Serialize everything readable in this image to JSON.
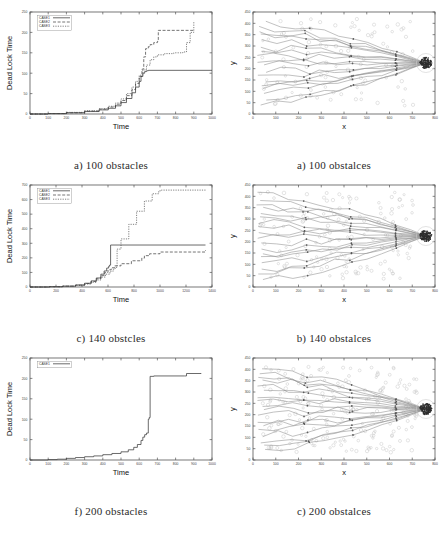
{
  "figure": {
    "rows": [
      {
        "left": {
          "caption": "a) 100 obstacles",
          "chart_ref": 0
        },
        "right": {
          "caption": "a) 100 obstalces",
          "chart_ref": 3
        }
      },
      {
        "left": {
          "caption": "c) 140 obstcles",
          "chart_ref": 1
        },
        "right": {
          "caption": "b) 140 obstalces",
          "chart_ref": 4
        }
      },
      {
        "left": {
          "caption": "f) 200 obstacles",
          "chart_ref": 2
        },
        "right": {
          "caption": "c) 200 obstalces",
          "chart_ref": 5
        }
      }
    ]
  },
  "chart_data": [
    {
      "type": "line",
      "title": "",
      "xlabel": "Time",
      "ylabel": "Dead Lock Time",
      "xlim": [
        0,
        1000
      ],
      "ylim": [
        0,
        250
      ],
      "xticks": [
        0,
        100,
        200,
        300,
        400,
        500,
        600,
        700,
        800,
        900,
        1000
      ],
      "yticks": [
        0,
        50,
        100,
        150,
        200,
        250
      ],
      "grid": false,
      "legend_position": "top-left",
      "series": [
        {
          "name": "CASE1",
          "style": "solid",
          "x": [
            0,
            100,
            200,
            300,
            380,
            430,
            470,
            500,
            530,
            560,
            580,
            600,
            610,
            620,
            630,
            640,
            650,
            1000
          ],
          "values": [
            0,
            1,
            3,
            6,
            10,
            14,
            20,
            28,
            38,
            52,
            66,
            80,
            92,
            100,
            104,
            106,
            107,
            107
          ]
        },
        {
          "name": "CASE2",
          "style": "dashed",
          "x": [
            0,
            100,
            200,
            300,
            380,
            430,
            470,
            500,
            530,
            560,
            580,
            600,
            615,
            625,
            635,
            650,
            660,
            680,
            700,
            705,
            900
          ],
          "values": [
            0,
            1,
            3,
            7,
            12,
            17,
            24,
            33,
            45,
            60,
            75,
            92,
            110,
            140,
            160,
            165,
            170,
            175,
            178,
            205,
            205
          ]
        },
        {
          "name": "CASE3",
          "style": "dotted",
          "x": [
            0,
            100,
            200,
            300,
            380,
            430,
            470,
            500,
            530,
            560,
            580,
            600,
            620,
            640,
            660,
            680,
            700,
            740,
            790,
            840,
            860,
            880,
            900
          ],
          "values": [
            0,
            1,
            4,
            8,
            13,
            19,
            27,
            37,
            50,
            66,
            80,
            95,
            108,
            120,
            133,
            140,
            145,
            148,
            150,
            152,
            175,
            200,
            228
          ]
        }
      ]
    },
    {
      "type": "line",
      "title": "",
      "xlabel": "Time",
      "ylabel": "Dead Lock Time",
      "xlim": [
        0,
        1400
      ],
      "ylim": [
        0,
        700
      ],
      "xticks": [
        0,
        200,
        400,
        600,
        800,
        1000,
        1200,
        1400
      ],
      "yticks": [
        0,
        100,
        200,
        300,
        400,
        500,
        600,
        700
      ],
      "grid": false,
      "legend_position": "top-left",
      "series": [
        {
          "name": "CASE1",
          "style": "solid",
          "x": [
            0,
            150,
            250,
            350,
            420,
            470,
            510,
            545,
            570,
            590,
            605,
            612,
            620,
            1350
          ],
          "values": [
            0,
            2,
            6,
            14,
            26,
            42,
            62,
            88,
            110,
            130,
            142,
            150,
            288,
            288
          ]
        },
        {
          "name": "CASE2",
          "style": "dashed",
          "x": [
            0,
            150,
            250,
            350,
            420,
            470,
            510,
            545,
            575,
            600,
            625,
            650,
            700,
            780,
            860,
            880,
            920,
            1000,
            1350
          ],
          "values": [
            0,
            2,
            6,
            13,
            24,
            38,
            56,
            78,
            100,
            118,
            132,
            145,
            160,
            180,
            198,
            215,
            228,
            240,
            252
          ]
        },
        {
          "name": "CASE3",
          "style": "dotted",
          "x": [
            0,
            150,
            250,
            350,
            420,
            470,
            510,
            545,
            580,
            615,
            640,
            655,
            670,
            700,
            760,
            820,
            880,
            940,
            990,
            1010,
            1350
          ],
          "values": [
            0,
            2,
            5,
            11,
            20,
            32,
            48,
            68,
            88,
            108,
            122,
            135,
            260,
            330,
            430,
            520,
            590,
            640,
            660,
            665,
            665
          ]
        }
      ]
    },
    {
      "type": "line",
      "title": "",
      "xlabel": "Time",
      "ylabel": "Dead Lock Time",
      "xlim": [
        0,
        1000
      ],
      "ylim": [
        0,
        250
      ],
      "xticks": [
        0,
        100,
        200,
        300,
        400,
        500,
        600,
        700,
        800,
        900,
        1000
      ],
      "yticks": [
        0,
        50,
        100,
        150,
        200,
        250
      ],
      "grid": false,
      "legend_position": "top-left",
      "series": [
        {
          "name": "CASE1",
          "style": "solid",
          "x": [
            0,
            100,
            150,
            200,
            250,
            300,
            350,
            400,
            450,
            500,
            540,
            570,
            590,
            610,
            620,
            630,
            640,
            650,
            655,
            660,
            680,
            850,
            860,
            940
          ],
          "values": [
            0,
            1,
            2,
            4,
            6,
            8,
            10,
            13,
            16,
            20,
            25,
            31,
            38,
            48,
            56,
            62,
            66,
            100,
            104,
            205,
            206,
            206,
            212,
            213
          ]
        }
      ]
    },
    {
      "type": "scatter",
      "title": "",
      "xlabel": "x",
      "ylabel": "y",
      "xlim": [
        0,
        800
      ],
      "ylim": [
        0,
        450
      ],
      "xticks": [
        0,
        100,
        200,
        300,
        400,
        500,
        600,
        700,
        800
      ],
      "yticks": [
        0,
        50,
        100,
        150,
        200,
        250,
        300,
        350,
        400,
        450
      ],
      "grid": false,
      "obstacle_count": 100,
      "goal": [
        760,
        225
      ],
      "trajectory_count": 18,
      "description": "robot trajectories converging to goal cluster"
    },
    {
      "type": "scatter",
      "title": "",
      "xlabel": "x",
      "ylabel": "y",
      "xlim": [
        0,
        800
      ],
      "ylim": [
        0,
        450
      ],
      "xticks": [
        0,
        100,
        200,
        300,
        400,
        500,
        600,
        700,
        800
      ],
      "yticks": [
        0,
        50,
        100,
        150,
        200,
        250,
        300,
        350,
        400,
        450
      ],
      "grid": false,
      "obstacle_count": 140,
      "goal": [
        760,
        225
      ],
      "trajectory_count": 18,
      "description": "robot trajectories converging to goal cluster"
    },
    {
      "type": "scatter",
      "title": "",
      "xlabel": "x",
      "ylabel": "y",
      "xlim": [
        0,
        800
      ],
      "ylim": [
        0,
        450
      ],
      "xticks": [
        0,
        100,
        200,
        300,
        400,
        500,
        600,
        700,
        800
      ],
      "yticks": [
        0,
        50,
        100,
        150,
        200,
        250,
        300,
        350,
        400,
        450
      ],
      "grid": false,
      "obstacle_count": 200,
      "goal": [
        760,
        225
      ],
      "trajectory_count": 18,
      "description": "robot trajectories converging to goal cluster"
    }
  ]
}
